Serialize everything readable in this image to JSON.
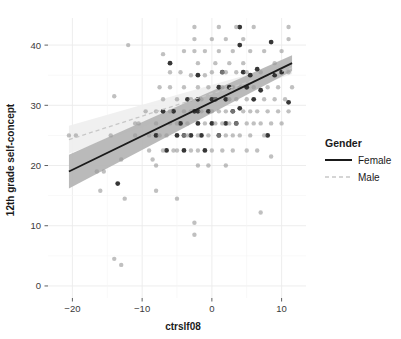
{
  "chart_data": {
    "type": "scatter",
    "title": "",
    "xlabel": "ctrslf08",
    "ylabel": "12th grade self-concept",
    "xlim": [
      -23.5,
      13.5
    ],
    "ylim": [
      -2.0,
      44.5
    ],
    "xticks": [
      -20,
      -10,
      0,
      10
    ],
    "xtick_labels": [
      "−20",
      "−10",
      "0",
      "10"
    ],
    "yticks": [
      0,
      10,
      20,
      30,
      40
    ],
    "ytick_labels": [
      "0",
      "10",
      "20",
      "30",
      "40"
    ],
    "grid": true,
    "legend": {
      "title": "Gender",
      "position": "right",
      "entries": [
        {
          "label": "Female",
          "line_style": "solid",
          "color": "#1a1a1a"
        },
        {
          "label": "Male",
          "line_style": "dashed",
          "color": "#c8c8c8"
        }
      ]
    },
    "series": [
      {
        "name": "Female",
        "color": "#1a1a1a",
        "point_color": "#2b2b2b",
        "fit_line": {
          "style": "solid",
          "x": [
            -20.5,
            11.5
          ],
          "y": [
            19.0,
            37.0
          ]
        },
        "confidence_band": {
          "x": [
            -20.5,
            11.5
          ],
          "lower": [
            16.2,
            35.7
          ],
          "upper": [
            21.8,
            38.3
          ]
        },
        "points": [
          [
            -13.5,
            17.0
          ],
          [
            -8.0,
            25.0
          ],
          [
            -7.0,
            29.0
          ],
          [
            -6.5,
            22.5
          ],
          [
            -6.0,
            37.0
          ],
          [
            -5.0,
            25.0
          ],
          [
            -4.5,
            27.0
          ],
          [
            -4.0,
            22.5
          ],
          [
            -4.0,
            25.0
          ],
          [
            -3.5,
            31.0
          ],
          [
            -3.0,
            25.0
          ],
          [
            -2.5,
            29.0
          ],
          [
            -2.0,
            31.0
          ],
          [
            -2.0,
            27.0
          ],
          [
            -2.0,
            35.0
          ],
          [
            -1.5,
            25.0
          ],
          [
            -1.0,
            22.5
          ],
          [
            -0.5,
            29.0
          ],
          [
            0.0,
            27.0
          ],
          [
            0.5,
            31.0
          ],
          [
            1.0,
            25.0
          ],
          [
            1.5,
            35.5
          ],
          [
            2.0,
            27.0
          ],
          [
            2.0,
            31.0
          ],
          [
            2.5,
            33.0
          ],
          [
            3.0,
            29.0
          ],
          [
            3.5,
            27.0
          ],
          [
            4.0,
            43.0
          ],
          [
            4.0,
            40.0
          ],
          [
            4.0,
            29.5
          ],
          [
            4.5,
            35.5
          ],
          [
            5.0,
            33.0
          ],
          [
            5.5,
            35.0
          ],
          [
            6.0,
            31.0
          ],
          [
            7.0,
            32.5
          ],
          [
            8.0,
            25.0
          ],
          [
            8.5,
            40.5
          ],
          [
            9.0,
            35.0
          ],
          [
            10.0,
            35.5
          ],
          [
            11.0,
            30.5
          ],
          [
            -2.0,
            29.0
          ],
          [
            0.0,
            31.0
          ],
          [
            1.0,
            33.0
          ],
          [
            6.5,
            36.0
          ],
          [
            -5.5,
            29.0
          ]
        ]
      },
      {
        "name": "Male",
        "color": "#c8c8c8",
        "point_color": "#9a9a9a",
        "fit_line": {
          "style": "dashed",
          "x": [
            -20.5,
            11.5
          ],
          "y": [
            24.3,
            36.2
          ]
        },
        "confidence_band": {
          "x": [
            -20.5,
            11.5
          ],
          "lower": [
            22.0,
            35.2
          ],
          "upper": [
            26.6,
            37.2
          ]
        },
        "points": [
          [
            -20.5,
            25.0
          ],
          [
            -19.5,
            25.0
          ],
          [
            -16.5,
            19.0
          ],
          [
            -16.0,
            15.8
          ],
          [
            -15.5,
            19.0
          ],
          [
            -14.5,
            25.0
          ],
          [
            -14.0,
            31.5
          ],
          [
            -14.0,
            4.5
          ],
          [
            -13.0,
            3.5
          ],
          [
            -12.5,
            14.5
          ],
          [
            -12.0,
            40.0
          ],
          [
            -11.0,
            27.0
          ],
          [
            -10.5,
            27.0
          ],
          [
            -9.5,
            29.0
          ],
          [
            -9.0,
            22.5
          ],
          [
            -8.5,
            21.0
          ],
          [
            -8.0,
            20.0
          ],
          [
            -8.0,
            27.0
          ],
          [
            -8.0,
            29.0
          ],
          [
            -8.0,
            15.8
          ],
          [
            -7.5,
            25.0
          ],
          [
            -7.0,
            38.5
          ],
          [
            -7.0,
            22.5
          ],
          [
            -7.0,
            31.0
          ],
          [
            -6.5,
            25.0
          ],
          [
            -6.0,
            29.0
          ],
          [
            -6.0,
            33.0
          ],
          [
            -6.0,
            35.5
          ],
          [
            -5.5,
            22.5
          ],
          [
            -5.0,
            27.0
          ],
          [
            -5.0,
            31.0
          ],
          [
            -5.0,
            14.5
          ],
          [
            -4.5,
            35.5
          ],
          [
            -4.0,
            29.0
          ],
          [
            -4.0,
            33.0
          ],
          [
            -4.0,
            39.0
          ],
          [
            -3.5,
            25.0
          ],
          [
            -3.5,
            27.0
          ],
          [
            -3.0,
            22.5
          ],
          [
            -3.0,
            31.0
          ],
          [
            -3.0,
            35.0
          ],
          [
            -2.5,
            43.0
          ],
          [
            -2.5,
            41.0
          ],
          [
            -2.5,
            39.0
          ],
          [
            -2.5,
            10.5
          ],
          [
            -2.5,
            8.5
          ],
          [
            -2.0,
            22.5
          ],
          [
            -2.0,
            25.0
          ],
          [
            -2.0,
            33.0
          ],
          [
            -2.0,
            37.0
          ],
          [
            -1.5,
            29.0
          ],
          [
            -1.5,
            31.0
          ],
          [
            -1.0,
            27.0
          ],
          [
            -1.0,
            35.0
          ],
          [
            -1.0,
            39.0
          ],
          [
            -0.5,
            25.0
          ],
          [
            -0.5,
            33.0
          ],
          [
            0.0,
            22.5
          ],
          [
            0.0,
            29.0
          ],
          [
            0.0,
            35.5
          ],
          [
            0.0,
            41.0
          ],
          [
            0.5,
            27.0
          ],
          [
            0.5,
            31.0
          ],
          [
            0.5,
            37.0
          ],
          [
            1.0,
            25.0
          ],
          [
            1.0,
            29.0
          ],
          [
            1.0,
            39.0
          ],
          [
            1.0,
            43.0
          ],
          [
            1.5,
            22.5
          ],
          [
            1.5,
            27.0
          ],
          [
            1.5,
            33.0
          ],
          [
            2.0,
            25.0
          ],
          [
            2.0,
            29.0
          ],
          [
            2.0,
            35.5
          ],
          [
            2.0,
            41.0
          ],
          [
            2.5,
            27.0
          ],
          [
            2.5,
            31.0
          ],
          [
            2.5,
            37.0
          ],
          [
            3.0,
            22.5
          ],
          [
            3.0,
            25.0
          ],
          [
            3.0,
            29.0
          ],
          [
            3.0,
            33.0
          ],
          [
            3.0,
            39.0
          ],
          [
            3.5,
            27.0
          ],
          [
            3.5,
            31.0
          ],
          [
            3.5,
            35.5
          ],
          [
            4.0,
            25.0
          ],
          [
            4.0,
            33.0
          ],
          [
            4.5,
            29.0
          ],
          [
            4.5,
            37.0
          ],
          [
            4.5,
            41.0
          ],
          [
            5.0,
            27.0
          ],
          [
            5.0,
            31.0
          ],
          [
            5.0,
            35.5
          ],
          [
            5.5,
            25.0
          ],
          [
            5.5,
            29.0
          ],
          [
            5.5,
            39.0
          ],
          [
            6.0,
            27.0
          ],
          [
            6.0,
            33.0
          ],
          [
            6.0,
            43.0
          ],
          [
            6.5,
            29.0
          ],
          [
            6.5,
            22.5
          ],
          [
            7.0,
            27.0
          ],
          [
            7.0,
            35.5
          ],
          [
            7.0,
            12.2
          ],
          [
            7.5,
            31.0
          ],
          [
            7.5,
            39.0
          ],
          [
            8.0,
            29.0
          ],
          [
            8.0,
            33.0
          ],
          [
            8.5,
            27.0
          ],
          [
            8.5,
            21.5
          ],
          [
            9.0,
            31.0
          ],
          [
            9.0,
            37.0
          ],
          [
            9.5,
            29.0
          ],
          [
            9.5,
            33.0
          ],
          [
            10.0,
            27.0
          ],
          [
            10.0,
            39.0
          ],
          [
            10.5,
            31.0
          ],
          [
            11.0,
            43.0
          ],
          [
            11.0,
            41.0
          ],
          [
            11.0,
            35.5
          ],
          [
            11.0,
            29.0
          ],
          [
            11.5,
            33.0
          ],
          [
            -1.0,
            45.0
          ],
          [
            -4.0,
            25.0
          ],
          [
            -9.0,
            25.0
          ],
          [
            -11.0,
            25.0
          ],
          [
            -13.0,
            21.0
          ],
          [
            2.0,
            20.0
          ],
          [
            -2.0,
            20.0
          ],
          [
            0.0,
            45.0
          ],
          [
            3.5,
            43.0
          ],
          [
            -6.0,
            27.0
          ],
          [
            -3.0,
            29.0
          ],
          [
            1.5,
            35.5
          ],
          [
            5.0,
            22.5
          ],
          [
            7.5,
            25.0
          ],
          [
            -0.5,
            20.0
          ],
          [
            -7.5,
            33.0
          ],
          [
            -5.0,
            22.5
          ]
        ]
      }
    ]
  }
}
